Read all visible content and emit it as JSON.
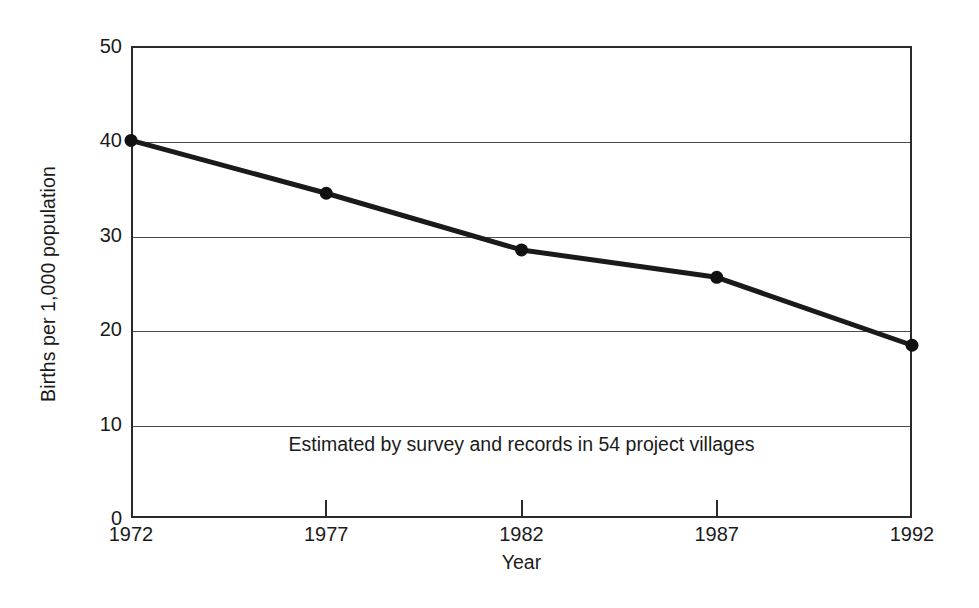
{
  "chart_data": {
    "type": "line",
    "title": "",
    "xlabel": "Year",
    "ylabel": "Births per 1,000 population",
    "x": [
      1972,
      1977,
      1982,
      1987,
      1992
    ],
    "xtick_labels": [
      "1972",
      "1977",
      "1982",
      "1987",
      "1992"
    ],
    "values": [
      40.0,
      34.4,
      28.4,
      25.5,
      18.3
    ],
    "series": [
      {
        "name": "Birth rate",
        "values": [
          40.0,
          34.4,
          28.4,
          25.5,
          18.3
        ]
      }
    ],
    "ylim": [
      0,
      50
    ],
    "xlim": [
      1972,
      1992
    ],
    "ytick_labels": [
      "0",
      "10",
      "20",
      "30",
      "40",
      "50"
    ],
    "yticks": [
      0,
      10,
      20,
      30,
      40,
      50
    ],
    "grid": "horizontal",
    "legend": "none",
    "annotations": [
      {
        "text": "Estimated by survey and records in 54 project villages",
        "x": 1982,
        "y": 7.5
      }
    ],
    "colors": {
      "line": "#1a1a1a",
      "marker": "#111111",
      "grid": "#4a4a4a",
      "frame": "#2a2a2a",
      "background": "#ffffff",
      "text": "#1b1b1b"
    },
    "line_width_px": 5,
    "marker": "circle",
    "marker_size_px": 13
  }
}
